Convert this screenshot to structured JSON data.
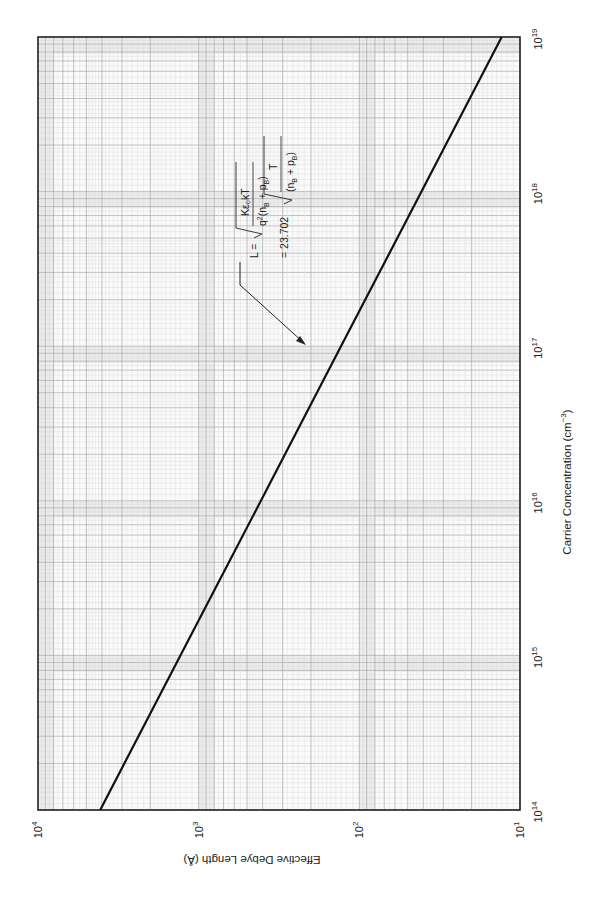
{
  "chart_data": {
    "type": "line",
    "title": "",
    "orientation_note": "figure printed rotated 90 degrees clockwise",
    "xlabel": "Carrier Concentration (cm⁻³)",
    "ylabel": "Effective Debye Length (Å)",
    "xscale": "log",
    "yscale": "log",
    "xlim": [
      100000000000000.0,
      1e+19
    ],
    "ylim": [
      10,
      10000
    ],
    "x_ticks": [
      "10^14",
      "10^15",
      "10^16",
      "10^17",
      "10^18",
      "10^19"
    ],
    "y_ticks": [
      "10^1",
      "10^2",
      "10^3",
      "10^4"
    ],
    "grid": true,
    "series": [
      {
        "name": "Effective Debye length (T = 300 K)",
        "x": [
          100000000000000.0,
          1000000000000000.0,
          1e+16,
          1e+17,
          1e+18,
          1e+19
        ],
        "y": [
          4100,
          1300,
          410,
          130,
          41,
          13
        ]
      }
    ],
    "annotations": [
      {
        "text": "L = sqrt( Kε₀kT / q²(n_B + p_B) ) = 23.702 sqrt( T / (n_B + p_B) )",
        "points_to_x": 8e+16
      }
    ]
  },
  "labels": {
    "x_axis": "Carrier Concentration (cm",
    "x_axis_exp": "−3",
    "x_axis_close": ")",
    "y_axis": "Effective Debye Length (Å)",
    "x_ticks": [
      {
        "base": "10",
        "exp": "14"
      },
      {
        "base": "10",
        "exp": "15"
      },
      {
        "base": "10",
        "exp": "16"
      },
      {
        "base": "10",
        "exp": "17"
      },
      {
        "base": "10",
        "exp": "18"
      },
      {
        "base": "10",
        "exp": "19"
      }
    ],
    "y_ticks": [
      {
        "base": "10",
        "exp": "1"
      },
      {
        "base": "10",
        "exp": "2"
      },
      {
        "base": "10",
        "exp": "3"
      },
      {
        "base": "10",
        "exp": "4"
      }
    ]
  },
  "equation": {
    "lhs": "L =",
    "num1": "Kε₀kT",
    "den1_pre": "q",
    "den1_sq": "2",
    "den1_post": "(n",
    "sub_B": "B",
    "plus": " + p",
    "close": ")",
    "eq2": "= 23.702",
    "num2": "T",
    "den2_pre": "(n"
  },
  "colors": {
    "grid_minor": "#d4d4d4",
    "grid_major": "#a8a8a8",
    "band": "#ececec",
    "frame": "#222222",
    "line": "#111111"
  }
}
